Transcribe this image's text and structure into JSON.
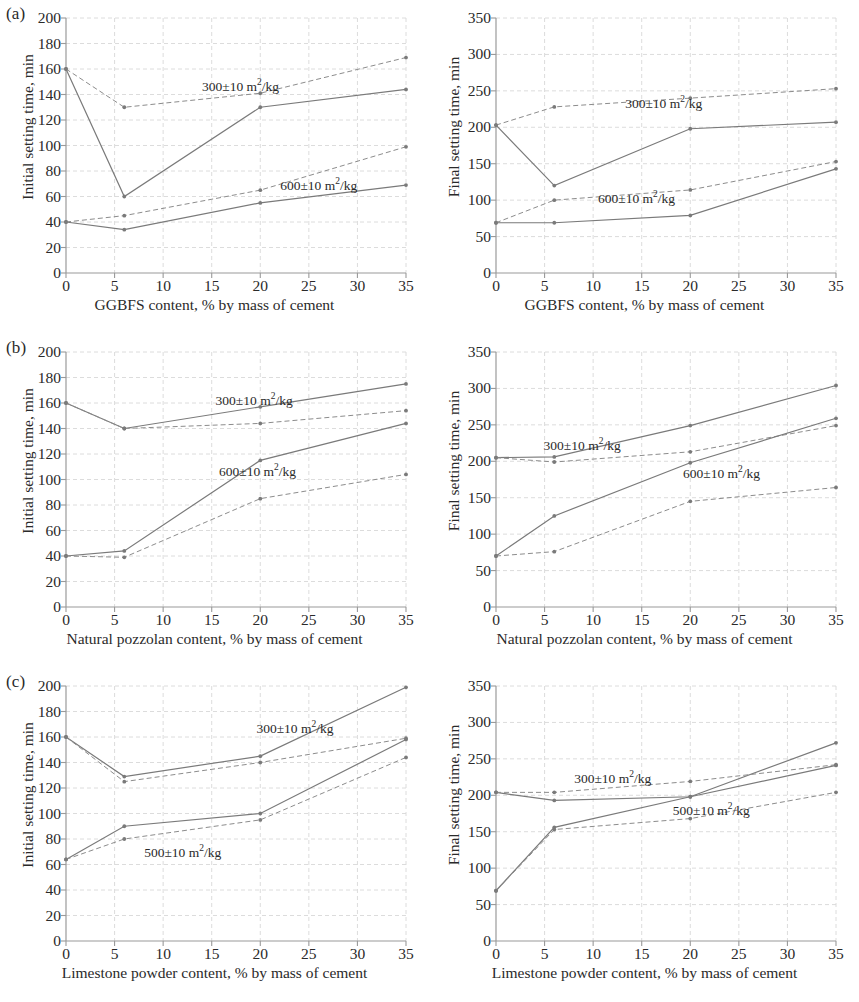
{
  "figure": {
    "panels": [
      {
        "tag": "(a)",
        "material": "GGBFS"
      },
      {
        "tag": "(b)",
        "material": "Natural pozzolan"
      },
      {
        "tag": "(c)",
        "material": "Limestone powder"
      }
    ]
  },
  "axis_labels": {
    "initial_y": "Initial setting time, min",
    "final_y": "Final setting time, min",
    "x_ggbfs": "GGBFS content, % by mass of cement",
    "x_pozzolan": "Natural pozzolan content, % by mass of cement",
    "x_limestone": "Limestone powder content, % by mass of cement"
  },
  "series_labels": {
    "s300": "300±10 m",
    "s300_sup": "2",
    "s300_tail": "/kg",
    "s500": "500±10 m",
    "s600": "600±10 m",
    "unit_prefix": " m",
    "unit_sup": "2",
    "unit_tail": "/kg"
  },
  "ticks": {
    "x": [
      "0",
      "5",
      "10",
      "15",
      "20",
      "25",
      "30",
      "35"
    ],
    "y_initial": [
      "0",
      "20",
      "40",
      "60",
      "80",
      "100",
      "120",
      "140",
      "160",
      "180",
      "200"
    ],
    "y_final": [
      "0",
      "50",
      "100",
      "150",
      "200",
      "250",
      "300",
      "350"
    ]
  },
  "colors": {
    "line": "#8c8c8c",
    "line_dark": "#7a7a7a",
    "grid": "#d8d8d8",
    "axis": "#9a9a9a",
    "text": "#2a2a2a",
    "background": "#ffffff"
  },
  "chart_data": [
    {
      "id": "a-initial",
      "type": "line",
      "title": "(a) Initial setting time vs GGBFS content",
      "xlabel": "GGBFS content, % by mass of cement",
      "ylabel": "Initial setting time, min",
      "xlim": [
        0,
        35
      ],
      "ylim": [
        0,
        200
      ],
      "grid": true,
      "legend": "inline-annotation",
      "x": [
        0,
        6,
        20,
        35
      ],
      "series": [
        {
          "name": "300±10 m2/kg (solid)",
          "style": "solid",
          "values": [
            160,
            60,
            130,
            144
          ]
        },
        {
          "name": "300±10 m2/kg (dashed)",
          "style": "dashed",
          "values": [
            160,
            130,
            141,
            169
          ]
        },
        {
          "name": "600±10 m2/kg (solid)",
          "style": "solid",
          "values": [
            40,
            34,
            55,
            69
          ]
        },
        {
          "name": "600±10 m2/kg (dashed)",
          "style": "dashed",
          "values": [
            40,
            45,
            65,
            99
          ]
        }
      ]
    },
    {
      "id": "a-final",
      "type": "line",
      "title": "(a) Final setting time vs GGBFS content",
      "xlabel": "GGBFS content, % by mass of cement",
      "ylabel": "Final setting time, min",
      "xlim": [
        0,
        35
      ],
      "ylim": [
        0,
        350
      ],
      "grid": true,
      "legend": "inline-annotation",
      "x": [
        0,
        6,
        20,
        35
      ],
      "series": [
        {
          "name": "300±10 m2/kg (solid)",
          "style": "solid",
          "values": [
            203,
            120,
            198,
            207
          ]
        },
        {
          "name": "300±10 m2/kg (dashed)",
          "style": "dashed",
          "values": [
            203,
            228,
            240,
            253
          ]
        },
        {
          "name": "600±10 m2/kg (solid)",
          "style": "solid",
          "values": [
            69,
            69,
            79,
            143
          ]
        },
        {
          "name": "600±10 m2/kg (dashed)",
          "style": "dashed",
          "values": [
            69,
            100,
            114,
            153
          ]
        }
      ]
    },
    {
      "id": "b-initial",
      "type": "line",
      "title": "(b) Initial setting time vs natural pozzolan content",
      "xlabel": "Natural pozzolan content, % by mass of cement",
      "ylabel": "Initial setting time, min",
      "xlim": [
        0,
        35
      ],
      "ylim": [
        0,
        200
      ],
      "grid": true,
      "legend": "inline-annotation",
      "x": [
        0,
        6,
        20,
        35
      ],
      "series": [
        {
          "name": "300±10 m2/kg (solid)",
          "style": "solid",
          "values": [
            160,
            140,
            157,
            175
          ]
        },
        {
          "name": "300±10 m2/kg (dashed)",
          "style": "dashed",
          "values": [
            160,
            140,
            144,
            154
          ]
        },
        {
          "name": "600±10 m2/kg (solid)",
          "style": "solid",
          "values": [
            40,
            44,
            115,
            144
          ]
        },
        {
          "name": "600±10 m2/kg (dashed)",
          "style": "dashed",
          "values": [
            40,
            39,
            85,
            104
          ]
        }
      ]
    },
    {
      "id": "b-final",
      "type": "line",
      "title": "(b) Final setting time vs natural pozzolan content",
      "xlabel": "Natural pozzolan content, % by mass of cement",
      "ylabel": "Final setting time, min",
      "xlim": [
        0,
        35
      ],
      "ylim": [
        0,
        350
      ],
      "grid": true,
      "legend": "inline-annotation",
      "x": [
        0,
        6,
        20,
        35
      ],
      "series": [
        {
          "name": "300±10 m2/kg (solid)",
          "style": "solid",
          "values": [
            205,
            206,
            249,
            304
          ]
        },
        {
          "name": "300±10 m2/kg (dashed)",
          "style": "dashed",
          "values": [
            205,
            199,
            213,
            249
          ]
        },
        {
          "name": "600±10 m2/kg (solid)",
          "style": "solid",
          "values": [
            70,
            125,
            198,
            259
          ]
        },
        {
          "name": "600±10 m2/kg (dashed)",
          "style": "dashed",
          "values": [
            70,
            76,
            145,
            164
          ]
        }
      ]
    },
    {
      "id": "c-initial",
      "type": "line",
      "title": "(c) Initial setting time vs limestone powder content",
      "xlabel": "Limestone powder content, % by mass of cement",
      "ylabel": "Initial setting time, min",
      "xlim": [
        0,
        35
      ],
      "ylim": [
        0,
        200
      ],
      "grid": true,
      "legend": "inline-annotation",
      "x": [
        0,
        6,
        20,
        35
      ],
      "series": [
        {
          "name": "300±10 m2/kg (solid)",
          "style": "solid",
          "values": [
            160,
            129,
            145,
            199
          ]
        },
        {
          "name": "300±10 m2/kg (dashed)",
          "style": "dashed",
          "values": [
            160,
            125,
            140,
            159
          ]
        },
        {
          "name": "500±10 m2/kg (solid)",
          "style": "solid",
          "values": [
            64,
            90,
            100,
            158
          ]
        },
        {
          "name": "500±10 m2/kg (dashed)",
          "style": "dashed",
          "values": [
            64,
            80,
            95,
            144
          ]
        }
      ]
    },
    {
      "id": "c-final",
      "type": "line",
      "title": "(c) Final setting time vs limestone powder content",
      "xlabel": "Limestone powder content, % by mass of cement",
      "ylabel": "Final setting time, min",
      "xlim": [
        0,
        350
      ],
      "ylim": [
        0,
        350
      ],
      "grid": true,
      "legend": "inline-annotation",
      "x": [
        0,
        6,
        20,
        35
      ],
      "series": [
        {
          "name": "300±10 m2/kg (solid)",
          "style": "solid",
          "values": [
            204,
            193,
            198,
            272
          ]
        },
        {
          "name": "300±10 m2/kg (dashed)",
          "style": "dashed",
          "values": [
            204,
            204,
            219,
            242
          ]
        },
        {
          "name": "500±10 m2/kg (solid)",
          "style": "solid",
          "values": [
            69,
            156,
            198,
            241
          ]
        },
        {
          "name": "500±10 m2/kg (dashed)",
          "style": "dashed",
          "values": [
            69,
            153,
            168,
            204
          ]
        }
      ]
    }
  ]
}
